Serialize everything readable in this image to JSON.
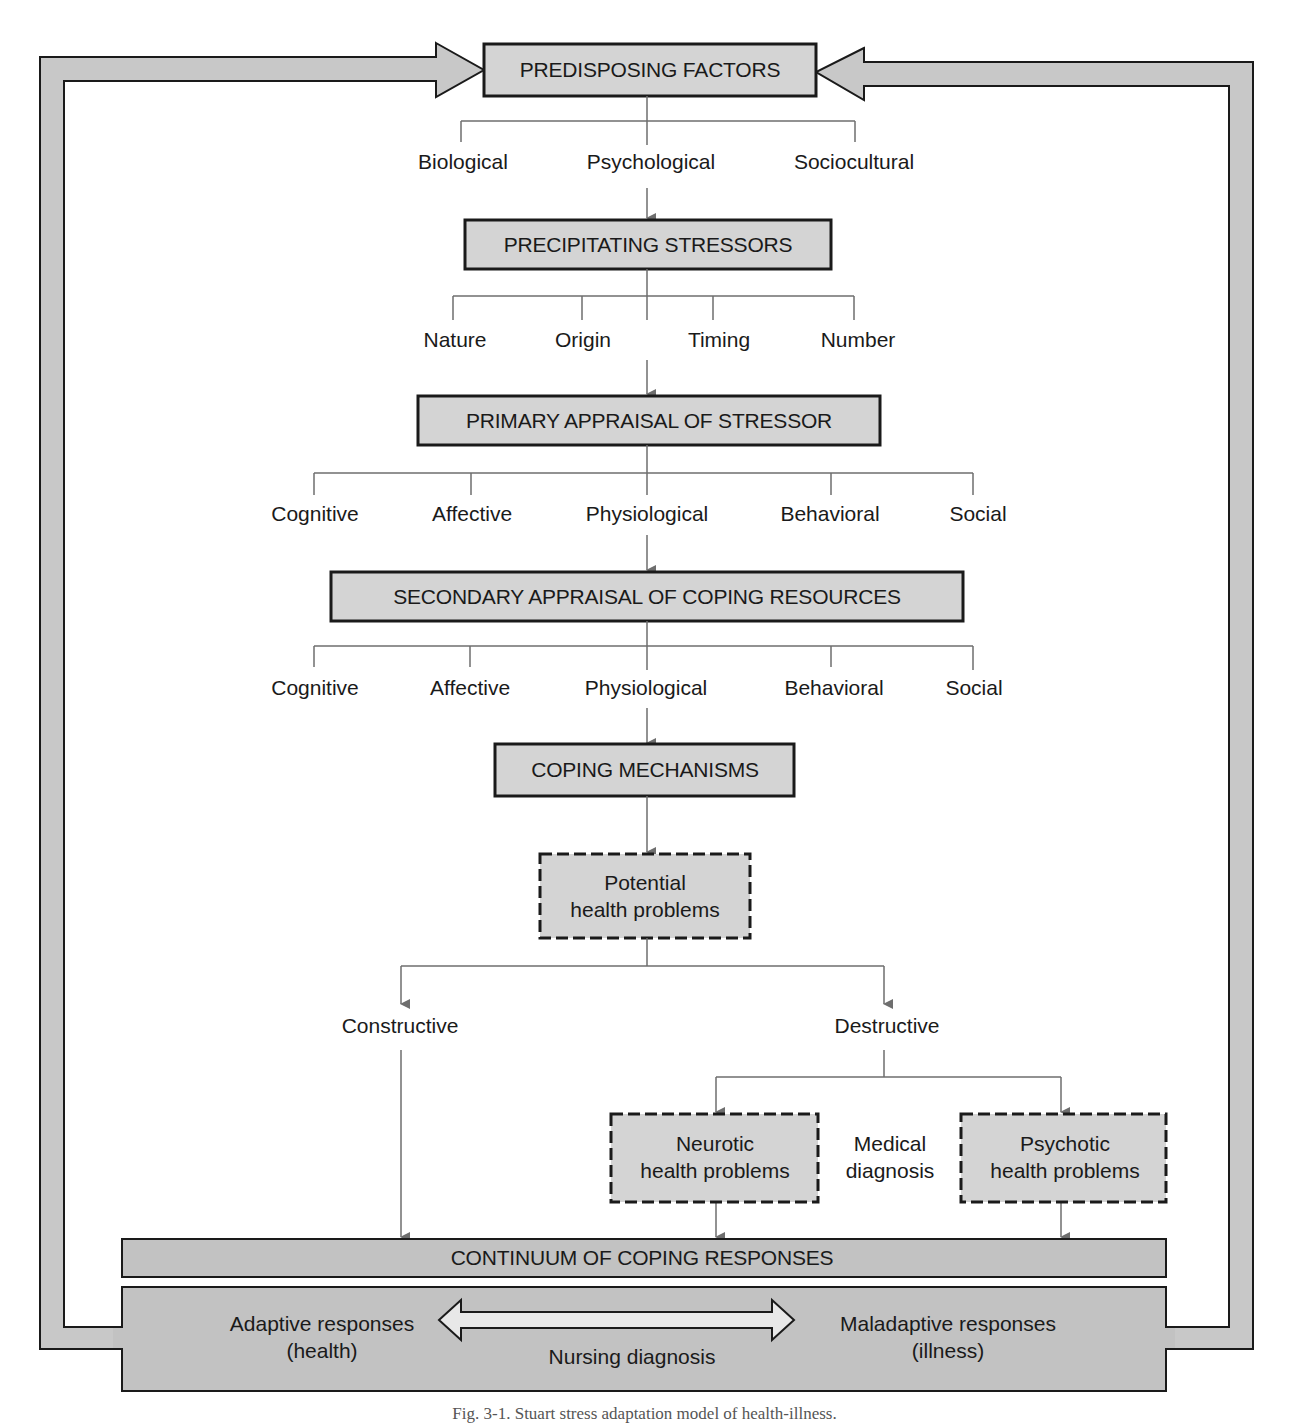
{
  "diagram": {
    "title": "Stuart stress adaptation model of health-illness",
    "colors": {
      "box_fill": "#d4d4d4",
      "band_fill": "#c2c2c2",
      "stroke": "#1a1a1a",
      "connector": "#6e6e6e",
      "text": "#1a1a1a"
    },
    "nodes": {
      "predisposing": "PREDISPOSING FACTORS",
      "precipitating": "PRECIPITATING STRESSORS",
      "primary_appraisal": "PRIMARY APPRAISAL OF STRESSOR",
      "secondary_appraisal": "SECONDARY APPRAISAL OF COPING RESOURCES",
      "coping_mechanisms": "COPING MECHANISMS",
      "potential": {
        "line1": "Potential",
        "line2": "health problems"
      },
      "neurotic": {
        "line1": "Neurotic",
        "line2": "health problems"
      },
      "psychotic": {
        "line1": "Psychotic",
        "line2": "health problems"
      },
      "continuum": "CONTINUUM OF COPING RESPONSES"
    },
    "predisposing_factors": [
      "Biological",
      "Psychological",
      "Sociocultural"
    ],
    "precipitating_stressors": [
      "Nature",
      "Origin",
      "Timing",
      "Number"
    ],
    "primary_appraisal_items": [
      "Cognitive",
      "Affective",
      "Physiological",
      "Behavioral",
      "Social"
    ],
    "secondary_appraisal_items": [
      "Cognitive",
      "Affective",
      "Physiological",
      "Behavioral",
      "Social"
    ],
    "outcomes": {
      "constructive": "Constructive",
      "destructive": "Destructive"
    },
    "medical_diagnosis": {
      "line1": "Medical",
      "line2": "diagnosis"
    },
    "responses": {
      "adaptive": {
        "line1": "Adaptive responses",
        "line2": "(health)"
      },
      "maladaptive": {
        "line1": "Maladaptive responses",
        "line2": "(illness)"
      },
      "nursing_diagnosis": "Nursing diagnosis"
    },
    "caption": "Fig. 3-1. Stuart stress adaptation model of health-illness."
  }
}
